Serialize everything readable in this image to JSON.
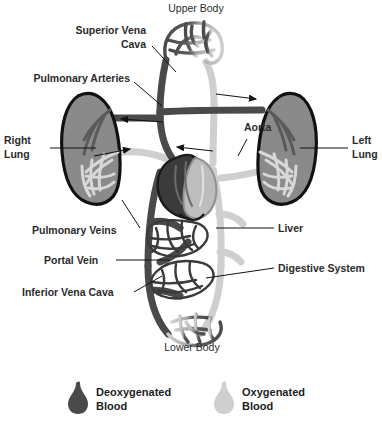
{
  "diagram": {
    "colors": {
      "deoxygenated": "#4a4a4a",
      "oxygenated": "#cfcfcf",
      "organ_fill": "#8a8a8a",
      "organ_outline": "#111111",
      "heart_dark": "#3b3b3b",
      "heart_light": "#bdbdbd",
      "label_text": "#2b2b2b",
      "leader_line": "#121212",
      "background": "#ffffff"
    },
    "labels": [
      {
        "id": "upper-body",
        "lines": [
          "Upper Body"
        ],
        "anchor": "middle",
        "x": 196,
        "y": 12,
        "weight": "normal"
      },
      {
        "id": "superior-vena-cava",
        "lines": [
          "Superior Vena",
          "Cava"
        ],
        "anchor": "end",
        "x": 146,
        "y": 34,
        "weight": "bold"
      },
      {
        "id": "pulmonary-arteries",
        "lines": [
          "Pulmonary Arteries"
        ],
        "anchor": "end",
        "x": 130,
        "y": 82,
        "weight": "bold"
      },
      {
        "id": "right-lung",
        "lines": [
          "Right",
          "Lung"
        ],
        "anchor": "start",
        "x": 4,
        "y": 144,
        "weight": "bold"
      },
      {
        "id": "aorta",
        "lines": [
          "Aorta"
        ],
        "anchor": "start",
        "x": 244,
        "y": 131,
        "weight": "bold"
      },
      {
        "id": "left-lung",
        "lines": [
          "Left",
          "Lung"
        ],
        "anchor": "start",
        "x": 352,
        "y": 144,
        "weight": "bold"
      },
      {
        "id": "pulmonary-veins",
        "lines": [
          "Pulmonary Veins"
        ],
        "anchor": "start",
        "x": 32,
        "y": 234,
        "weight": "bold"
      },
      {
        "id": "liver",
        "lines": [
          "Liver"
        ],
        "anchor": "start",
        "x": 278,
        "y": 232,
        "weight": "bold"
      },
      {
        "id": "portal-vein",
        "lines": [
          "Portal Vein"
        ],
        "anchor": "start",
        "x": 44,
        "y": 264,
        "weight": "bold"
      },
      {
        "id": "digestive-system",
        "lines": [
          "Digestive System"
        ],
        "anchor": "start",
        "x": 278,
        "y": 272,
        "weight": "bold"
      },
      {
        "id": "inferior-vena-cava",
        "lines": [
          "Inferior Vena Cava"
        ],
        "anchor": "start",
        "x": 22,
        "y": 296,
        "weight": "bold"
      },
      {
        "id": "lower-body",
        "lines": [
          "Lower Body"
        ],
        "anchor": "middle",
        "x": 192,
        "y": 351,
        "weight": "normal"
      }
    ],
    "flow_arrows": [
      {
        "id": "pulmonary-artery-flow-left",
        "direction": "left"
      },
      {
        "id": "pulmonary-vein-flow-left",
        "direction": "right"
      },
      {
        "id": "pulmonary-artery-flow-right",
        "direction": "right"
      },
      {
        "id": "pulmonary-vein-flow-right",
        "direction": "left"
      }
    ],
    "organs": [
      {
        "id": "right-lung-organ",
        "name": "Right Lung"
      },
      {
        "id": "left-lung-organ",
        "name": "Left Lung"
      },
      {
        "id": "heart-organ",
        "name": "Heart"
      },
      {
        "id": "liver-organ",
        "name": "Liver"
      },
      {
        "id": "digestive-organ",
        "name": "Digestive System"
      },
      {
        "id": "upper-body-capillaries",
        "name": "Upper Body Capillary Bed"
      },
      {
        "id": "lower-body-capillaries",
        "name": "Lower Body Capillary Bed"
      }
    ]
  },
  "legend": {
    "items": [
      {
        "id": "deoxygenated",
        "label_line1": "Deoxygenated",
        "label_line2": "Blood",
        "color": "#4a4a4a",
        "icon": "blood-drop-icon"
      },
      {
        "id": "oxygenated",
        "label_line1": "Oxygenated",
        "label_line2": "Blood",
        "color": "#cfcfcf",
        "icon": "blood-drop-icon"
      }
    ]
  }
}
